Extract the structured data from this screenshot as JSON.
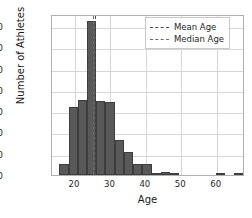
{
  "chart_data": {
    "type": "bar",
    "title": "",
    "xlabel": "Age",
    "ylabel": "Number of Athletes",
    "xlim": [
      13.5,
      68.0
    ],
    "ylim": [
      0,
      378
    ],
    "grid": true,
    "bin_width": 2.6,
    "bin_starts": [
      15.6,
      18.2,
      20.8,
      23.4,
      26.0,
      28.6,
      31.2,
      33.8,
      36.4,
      39.0,
      41.6,
      44.2,
      46.8,
      49.4,
      52.0,
      54.6,
      57.2,
      59.8,
      62.4,
      65.0
    ],
    "categories": [
      "15.6-18.2",
      "18.2-20.8",
      "20.8-23.4",
      "23.4-26.0",
      "26.0-28.6",
      "28.6-31.2",
      "31.2-33.8",
      "33.8-36.4",
      "36.4-39.0",
      "39.0-41.6",
      "41.6-44.2",
      "44.2-46.8",
      "46.8-49.4",
      "49.4-52.0",
      "52.0-54.6",
      "54.6-57.2",
      "57.2-59.8",
      "59.8-62.4",
      "62.4-65.0",
      "65.0-67.6"
    ],
    "values": [
      25,
      160,
      175,
      362,
      173,
      171,
      83,
      55,
      25,
      25,
      5,
      6,
      2,
      0,
      0,
      0,
      0,
      1,
      0,
      1
    ],
    "xticks": [
      20,
      30,
      40,
      50,
      60
    ],
    "yticks": [
      0,
      50,
      100,
      150,
      200,
      250,
      300,
      350
    ],
    "bar_color": "#595959",
    "bar_edge_color": "#3d3d3d",
    "grid_color": "#d6d6d6",
    "annotations": [
      {
        "name": "mean",
        "label": "Mean Age",
        "value": 25.6,
        "style": "dashed",
        "color": "#4a4a4a"
      },
      {
        "name": "median",
        "label": "Median Age",
        "value": 25.0,
        "style": "dashed",
        "color": "#6b6b6b"
      }
    ],
    "legend": {
      "position": "upper right",
      "entries": [
        {
          "label": "Mean Age",
          "style": "dashed",
          "color": "#4a4a4a"
        },
        {
          "label": "Median Age",
          "style": "dashed",
          "color": "#6b6b6b"
        }
      ]
    }
  }
}
